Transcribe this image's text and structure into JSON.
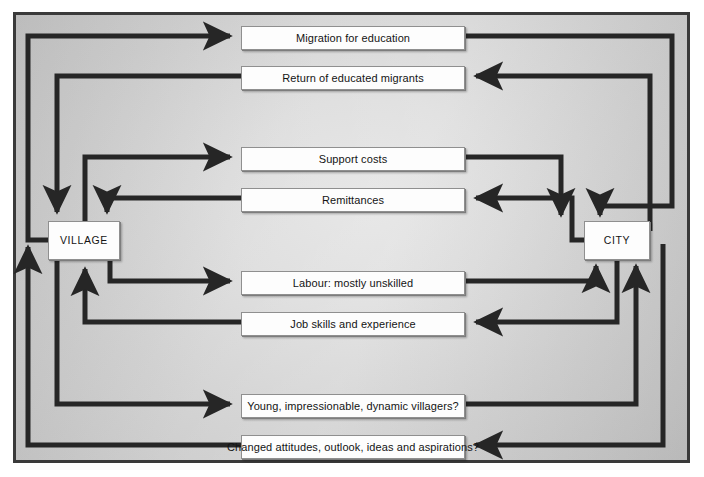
{
  "diagram": {
    "style": {
      "wire_color": "#262626",
      "frame_color": "#3a3a3a",
      "node_fill": "#fdfdfd",
      "panel_background": "#d6d6d6"
    },
    "endpoints": [
      {
        "id": "village",
        "label": "VILLAGE"
      },
      {
        "id": "city",
        "label": "CITY"
      }
    ],
    "flows": [
      {
        "id": "migration-for-education",
        "label": "Migration for education",
        "direction": "village-to-city"
      },
      {
        "id": "return-of-educated-migrants",
        "label": "Return of educated migrants",
        "direction": "city-to-village"
      },
      {
        "id": "support-costs",
        "label": "Support costs",
        "direction": "village-to-city"
      },
      {
        "id": "remittances",
        "label": "Remittances",
        "direction": "city-to-village"
      },
      {
        "id": "labour-mostly-unskilled",
        "label": "Labour: mostly unskilled",
        "direction": "village-to-city"
      },
      {
        "id": "job-skills-and-experience",
        "label": "Job skills and experience",
        "direction": "city-to-village"
      },
      {
        "id": "young-impressionable",
        "label": "Young, impressionable, dynamic villagers?",
        "direction": "village-to-city"
      },
      {
        "id": "changed-attitudes",
        "label": "Changed attitudes, outlook, ideas and aspirations?",
        "direction": "city-to-village"
      }
    ]
  }
}
